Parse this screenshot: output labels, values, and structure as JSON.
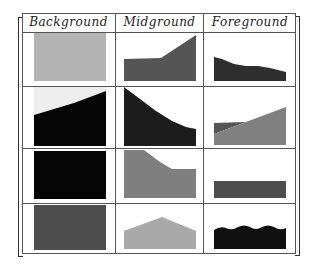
{
  "table": {
    "headers": [
      "Background",
      "Midground",
      "Foreground"
    ],
    "rows": [
      {
        "background": "solid light gray",
        "midground": "dark gray slope rising right",
        "foreground": "black descending band"
      },
      {
        "background": "black terrain under light sky",
        "midground": "black slope descending right",
        "foreground": "gray rising wedge over dark"
      },
      {
        "background": "solid black",
        "midground": "gray plateau descending",
        "foreground": "dark gray flat bar"
      },
      {
        "background": "solid dark gray",
        "midground": "light gray peak",
        "foreground": "black wavy bar"
      }
    ]
  },
  "colors": {
    "light_gray": "#b3b3b3",
    "mid_gray": "#7f7f7f",
    "dark_gray": "#4d4d4d",
    "darker": "#2e2e2e",
    "black": "#050505",
    "light_sky": "#eeeeee",
    "peak_gray": "#a9a9a9"
  }
}
